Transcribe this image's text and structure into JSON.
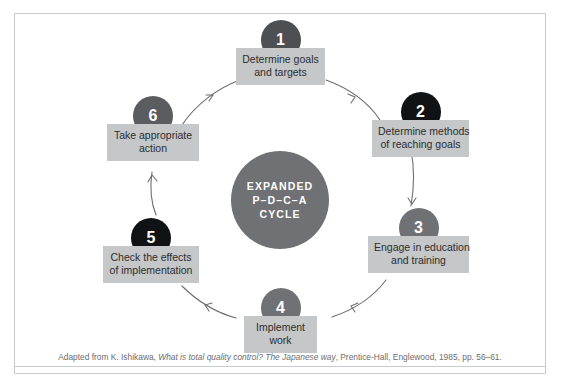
{
  "figure": {
    "background_color": "#ffffff",
    "frame_color": "#c9cbcd"
  },
  "hub": {
    "name": "expanded-pdca-cycle-hub",
    "line1": "EXPANDED",
    "line2": "P–D–C–A",
    "line3": "CYCLE",
    "fill_color": "#6f7174",
    "text_color": "#ffffff"
  },
  "nodes": [
    {
      "number": "1",
      "line1": "Determine goals",
      "line2": "and targets",
      "circle_color": "#4d4f52",
      "box_color": "#c5c7c9"
    },
    {
      "number": "2",
      "line1": "Determine methods",
      "line2": "of reaching goals",
      "circle_color": "#111214",
      "box_color": "#c5c7c9"
    },
    {
      "number": "3",
      "line1": "Engage in education",
      "line2": "and training",
      "circle_color": "#6f7174",
      "box_color": "#c5c7c9"
    },
    {
      "number": "4",
      "line1": "Implement",
      "line2": "work",
      "circle_color": "#6f7174",
      "box_color": "#c5c7c9"
    },
    {
      "number": "5",
      "line1": "Check the effects",
      "line2": "of implementation",
      "circle_color": "#111214",
      "box_color": "#c5c7c9"
    },
    {
      "number": "6",
      "line1": "Take appropriate",
      "line2": "action",
      "circle_color": "#5a5c5f",
      "box_color": "#c5c7c9"
    }
  ],
  "caption": {
    "prefix": "Adapted from K. Ishikawa, ",
    "italic1": "What is total quality control? The Japanese way",
    "suffix": ", Prentice-Hall, Englewood, 1985, pp. 56–61.",
    "color": "#6b6d70"
  },
  "arrows": {
    "color": "#6b6d70",
    "direction": "clockwise",
    "count": 6
  }
}
